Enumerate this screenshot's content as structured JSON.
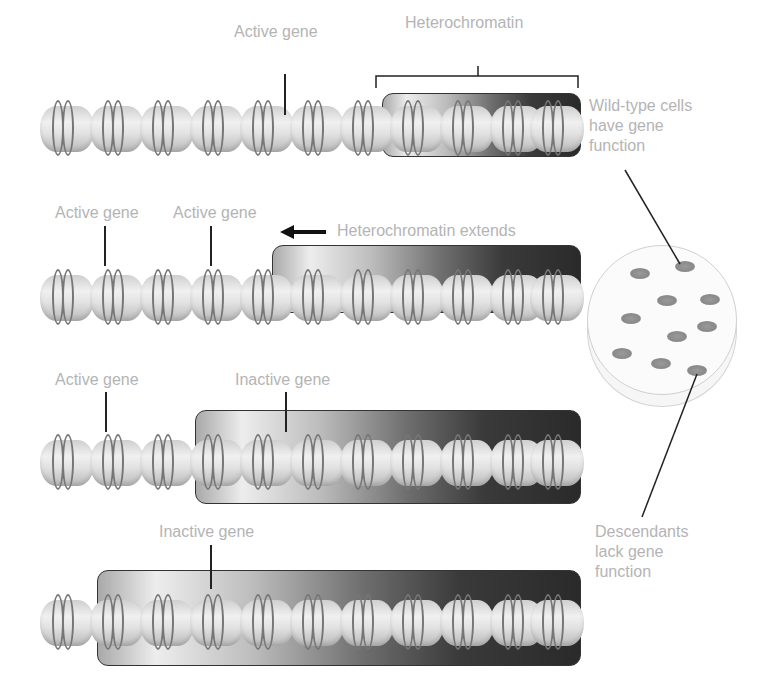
{
  "diagram": {
    "rows": [
      {
        "id": "row1",
        "labels": [
          {
            "text": "Active gene",
            "type": "active"
          }
        ],
        "heterochromatin_label": "Heterochromatin"
      },
      {
        "id": "row2",
        "labels": [
          {
            "text": "Active gene",
            "type": "active"
          },
          {
            "text": "Active gene",
            "type": "active"
          }
        ],
        "heterochromatin_label": "Heterochromatin extends",
        "arrow": "left-arrow"
      },
      {
        "id": "row3",
        "labels": [
          {
            "text": "Active gene",
            "type": "active"
          },
          {
            "text": "Inactive gene",
            "type": "inactive"
          }
        ]
      },
      {
        "id": "row4",
        "labels": [
          {
            "text": "Inactive gene",
            "type": "inactive"
          }
        ]
      }
    ],
    "dish": {
      "top_label": "Wild-type cells\nhave gene\nfunction",
      "bottom_label": "Descendants\nlack gene\nfunction",
      "colony_count": 10
    },
    "colors": {
      "label_text": "#b4b4b4",
      "leader_line": "#222222",
      "heterochromatin_light": "#ededed",
      "heterochromatin_dark": "#2a2a2a",
      "nucleosome": "#e2e2e2",
      "dna_ring": "#767676"
    }
  }
}
